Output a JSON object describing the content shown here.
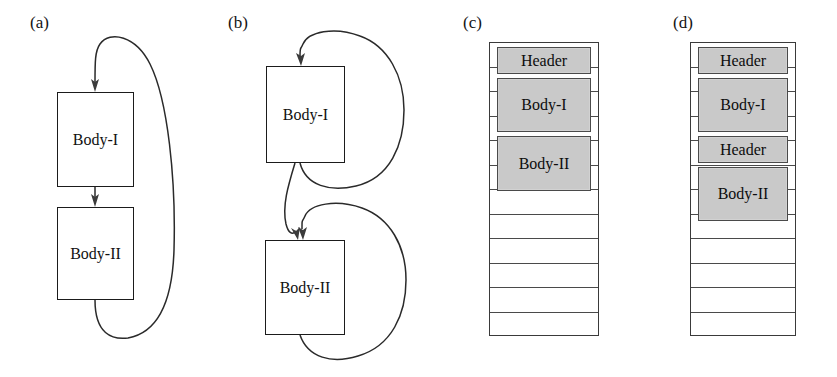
{
  "figure": {
    "panels": [
      {
        "id": "a",
        "label": "(a)",
        "type": "flow",
        "boxes": [
          {
            "name": "body-1",
            "label": "Body-I"
          },
          {
            "name": "body-2",
            "label": "Body-II"
          }
        ],
        "edges": [
          {
            "name": "entry-arrow-to-body-1",
            "kind": "arrow-down"
          },
          {
            "name": "body-1-to-body-2",
            "kind": "arrow-down"
          },
          {
            "name": "body-2-back-to-body-1",
            "kind": "back-edge-loop"
          }
        ]
      },
      {
        "id": "b",
        "label": "(b)",
        "type": "flow",
        "boxes": [
          {
            "name": "body-1",
            "label": "Body-I"
          },
          {
            "name": "body-2",
            "label": "Body-II"
          }
        ],
        "edges": [
          {
            "name": "entry-arrow-to-body-1",
            "kind": "arrow-down"
          },
          {
            "name": "body-1-self-loop",
            "kind": "back-edge-loop"
          },
          {
            "name": "body-1-to-body-2",
            "kind": "arrow-down"
          },
          {
            "name": "body-2-self-loop",
            "kind": "back-edge-loop"
          }
        ]
      },
      {
        "id": "c",
        "label": "(c)",
        "type": "stack",
        "rows": 12,
        "blocks": [
          {
            "name": "header-block",
            "label": "Header",
            "span": 1,
            "start": 0
          },
          {
            "name": "body-1-block",
            "label": "Body-I",
            "span": 2,
            "start": 1
          },
          {
            "name": "body-2-block",
            "label": "Body-II",
            "span": 2,
            "start": 3
          }
        ],
        "empty_rows": 7
      },
      {
        "id": "d",
        "label": "(d)",
        "type": "stack",
        "rows": 12,
        "blocks": [
          {
            "name": "header-block-1",
            "label": "Header",
            "span": 1,
            "start": 0
          },
          {
            "name": "body-1-block",
            "label": "Body-I",
            "span": 2,
            "start": 1
          },
          {
            "name": "header-block-2",
            "label": "Header",
            "span": 1,
            "start": 3
          },
          {
            "name": "body-2-block",
            "label": "Body-II",
            "span": 2,
            "start": 4
          }
        ],
        "empty_rows": 6
      }
    ],
    "colors": {
      "block_fill": "#c9c9c9",
      "stroke": "#3a3a3a",
      "box_stroke": "#1b1b1b",
      "background": "#ffffff",
      "text": "#111111"
    }
  }
}
